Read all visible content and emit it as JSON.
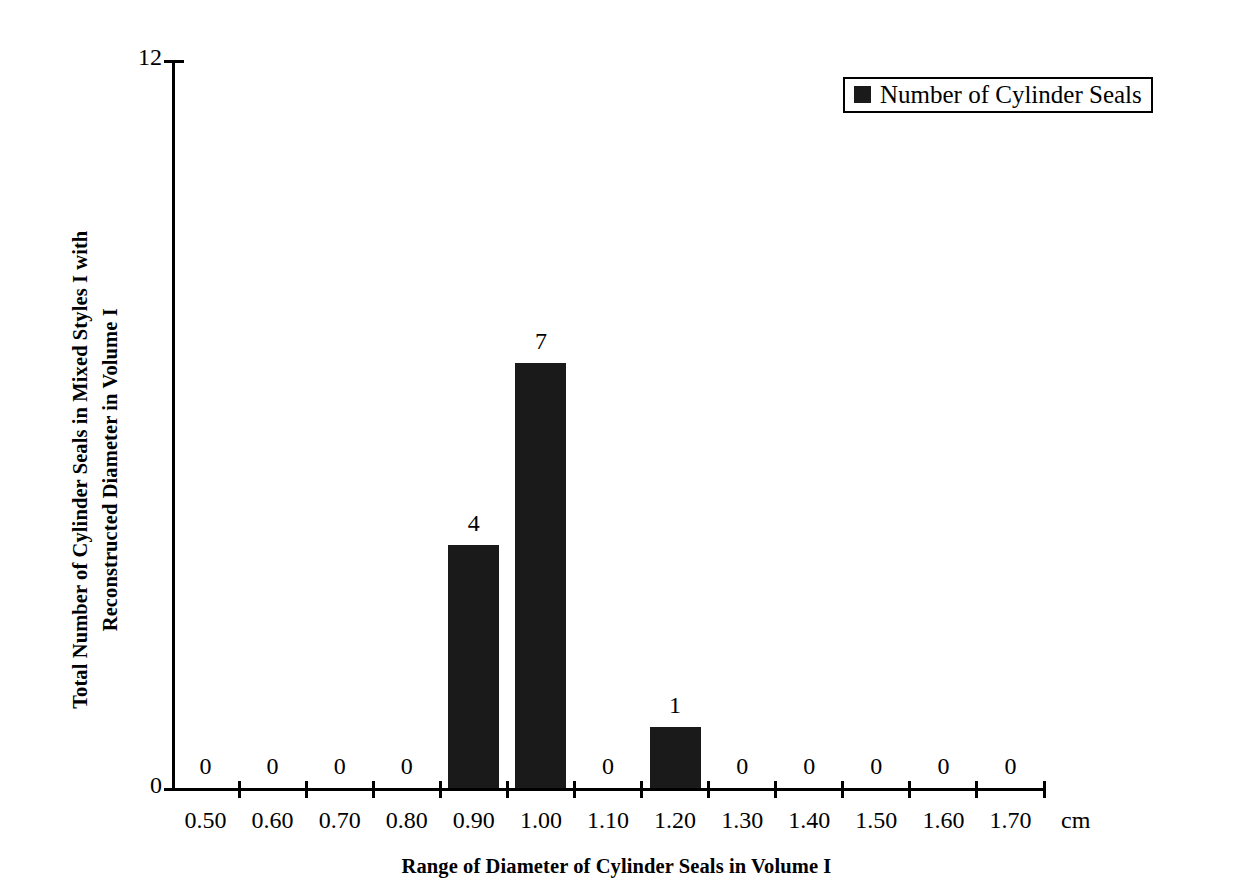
{
  "chart_data": {
    "type": "bar",
    "title": "",
    "categories": [
      "0.50",
      "0.60",
      "0.70",
      "0.80",
      "0.90",
      "1.00",
      "1.10",
      "1.20",
      "1.30",
      "1.40",
      "1.50",
      "1.60",
      "1.70"
    ],
    "values": [
      0,
      0,
      0,
      0,
      4,
      7,
      0,
      1,
      0,
      0,
      0,
      0,
      0
    ],
    "series": [
      {
        "name": "Number of Cylinder Seals",
        "values": [
          0,
          0,
          0,
          0,
          4,
          7,
          0,
          1,
          0,
          0,
          0,
          0,
          0
        ],
        "color": "#1a1a1a"
      }
    ],
    "xlabel": "Range of Diameter of Cylinder Seals in Volume I",
    "ylabel": "Total Number of Cylinder Seals in Mixed Styles I with Reconstructed Diameter in Volume I",
    "x_unit": "cm",
    "ylim": [
      0,
      12
    ],
    "y_tick_labels": [
      "0",
      "12"
    ],
    "grid": false,
    "data_labels": [
      "0",
      "0",
      "0",
      "0",
      "4",
      "7",
      "0",
      "1",
      "0",
      "0",
      "0",
      "0",
      "0"
    ],
    "legend": {
      "position": "top-right",
      "entries": [
        {
          "label": "Number of Cylinder Seals",
          "marker": "filled-square",
          "color": "#1a1a1a"
        }
      ]
    }
  },
  "axis": {
    "y_title_line1": "Total Number of Cylinder Seals in Mixed Styles I with",
    "y_title_line2": "Reconstructed Diameter in Volume I",
    "y_max_label": "12",
    "y_min_label": "0",
    "x_title": "Range of Diameter of Cylinder Seals in Volume I",
    "x_unit": "cm"
  },
  "legend": {
    "label": "Number of Cylinder Seals"
  }
}
